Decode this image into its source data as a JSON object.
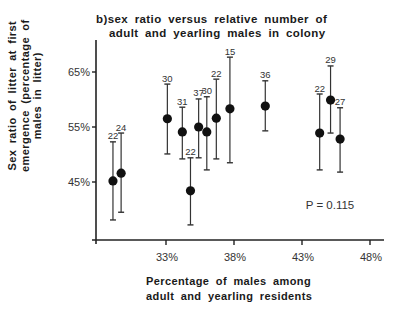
{
  "chart_data": {
    "type": "scatter",
    "title": "b)sex ratio versus relative number of adult and yearling males in colony",
    "title_lines": [
      "b)sex ratio  versus  relative  number  of",
      "adult  and  yearling  males  in  colony"
    ],
    "xlabel": "Percentage of males among adult and yearling residents",
    "xlabel_lines": [
      "Percentage  of  males  among",
      "adult  and  yearling  residents"
    ],
    "ylabel": "Sex ratio of litter at first emergence (percentage of males in litter)",
    "ylabel_lines": [
      "Sex  ratio  of  litter  at  first",
      "emergence  (percentage  of",
      "males  in  litter)"
    ],
    "xlim": [
      28,
      48.5
    ],
    "ylim": [
      34,
      70
    ],
    "x_ticks": [
      33,
      38,
      43,
      48
    ],
    "x_tick_labels": [
      "33%",
      "38%",
      "43%",
      "48%"
    ],
    "y_ticks": [
      45,
      55,
      65
    ],
    "y_tick_labels": [
      "45%",
      "55%",
      "65%"
    ],
    "grid": false,
    "annotation": "P = 0.115",
    "points": [
      {
        "x": 29.1,
        "y": 45.2,
        "upper": 52.3,
        "lower": 38.1,
        "n": "22"
      },
      {
        "x": 29.7,
        "y": 46.6,
        "upper": 53.9,
        "lower": 39.5,
        "n": "24"
      },
      {
        "x": 33.1,
        "y": 56.5,
        "upper": 62.8,
        "lower": 50.1,
        "n": "30"
      },
      {
        "x": 34.2,
        "y": 54.1,
        "upper": 58.6,
        "lower": 49.2,
        "n": "31"
      },
      {
        "x": 34.8,
        "y": 43.4,
        "upper": 49.4,
        "lower": 37.2,
        "n": "22"
      },
      {
        "x": 35.4,
        "y": 55.0,
        "upper": 60.1,
        "lower": 49.4,
        "n": "37"
      },
      {
        "x": 36.0,
        "y": 54.1,
        "upper": 60.5,
        "lower": 47.2,
        "n": "30"
      },
      {
        "x": 36.7,
        "y": 56.6,
        "upper": 63.7,
        "lower": 49.2,
        "n": "22"
      },
      {
        "x": 37.7,
        "y": 58.3,
        "upper": 67.7,
        "lower": 48.5,
        "n": "15"
      },
      {
        "x": 40.3,
        "y": 58.8,
        "upper": 63.4,
        "lower": 54.3,
        "n": "36"
      },
      {
        "x": 44.3,
        "y": 53.9,
        "upper": 61.0,
        "lower": 47.2,
        "n": "22"
      },
      {
        "x": 45.1,
        "y": 59.9,
        "upper": 66.1,
        "lower": 53.9,
        "n": "29"
      },
      {
        "x": 45.8,
        "y": 52.8,
        "upper": 58.5,
        "lower": 46.8,
        "n": "27"
      }
    ],
    "colors": {
      "marker": "#111111",
      "axis": "#222222",
      "text": "#333333"
    }
  }
}
